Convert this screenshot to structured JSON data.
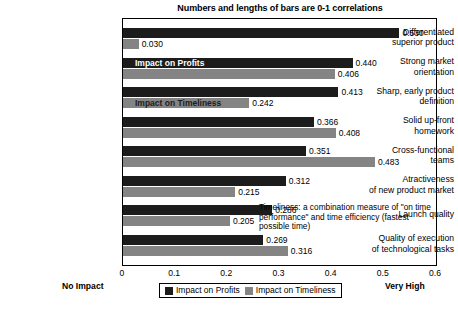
{
  "chart_data": {
    "type": "bar",
    "orientation": "horizontal",
    "title": "Numbers and lengths of bars are 0-1 correlations",
    "xlabel": "",
    "ylabel": "",
    "xlim": [
      0,
      0.6
    ],
    "xticks": [
      "0",
      "0.1",
      "0.2",
      "0.3",
      "0.4",
      "0.5",
      "0.6"
    ],
    "xtick_values": [
      0,
      0.1,
      0.2,
      0.3,
      0.4,
      0.5,
      0.6
    ],
    "grid": false,
    "legend_position": "bottom-center",
    "categories": [
      "Differentiated superior product",
      "Strong market orientation",
      "Sharp, early product definition",
      "Solid up-front homework",
      "Cross-functional teams",
      "Atractiveness of new product market",
      "Launch quality",
      "Quality of execution of technological tasks"
    ],
    "category_lines": [
      [
        "Differentiated",
        "superior product"
      ],
      [
        "Strong market",
        "orientation"
      ],
      [
        "Sharp, early product",
        "definition"
      ],
      [
        "Solid up-front",
        "homework"
      ],
      [
        "Cross-functional",
        "teams"
      ],
      [
        "Atractiveness",
        "of new product market"
      ],
      [
        "Launch quality"
      ],
      [
        "Quality of execution",
        "of technological tasks"
      ]
    ],
    "series": [
      {
        "name": "Impact on Profits",
        "color": "#1c1c1c",
        "values": [
          0.53,
          0.44,
          0.413,
          0.366,
          0.351,
          0.312,
          0.286,
          0.269
        ],
        "labels": [
          "0.530",
          "0.440",
          "0.413",
          "0.366",
          "0.351",
          "0.312",
          "0.286",
          "0.269"
        ]
      },
      {
        "name": "Impact on Timeliness",
        "color": "#848484",
        "values": [
          0.03,
          0.406,
          0.242,
          0.408,
          0.483,
          0.215,
          0.205,
          0.316
        ],
        "labels": [
          "0.030",
          "0.406",
          "0.242",
          "0.408",
          "0.483",
          "0.215",
          "0.205",
          "0.316"
        ]
      }
    ],
    "annotations": [
      {
        "name": "inline-profits-label",
        "text": "Impact on Profits",
        "category_index": 1,
        "series_index": 0
      },
      {
        "name": "inline-timeliness-label",
        "text": "Impact on Timeliness",
        "category_index": 2,
        "series_index": 1
      }
    ],
    "note": "Timeliness: a combination measure of \"on time performance\" and time efficiency (fastest possible time)",
    "axis_end_left": "No Impact",
    "axis_end_right": "Very High"
  }
}
